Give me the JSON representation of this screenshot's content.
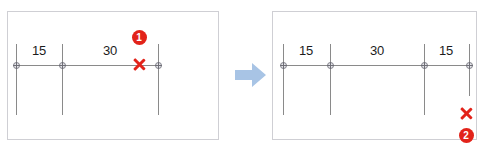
{
  "figure": {
    "clipped_header_text": "▪ ▪  ▪ ▪   ▪",
    "arrow_color": "#a8c4e5",
    "callout_color": "#e2231a",
    "line_color": "#8a8a8a"
  },
  "panels": [
    {
      "id": "before",
      "nodes": [
        {
          "x": 16,
          "label": null
        },
        {
          "x": 62,
          "label": null
        },
        {
          "x": 158,
          "label": null
        }
      ],
      "dimensions": [
        {
          "text": "15",
          "center_x": 39
        },
        {
          "text": "30",
          "center_x": 110
        }
      ],
      "callout": {
        "x_mark_x": 139,
        "x_mark_y": 64,
        "badge_x": 139,
        "badge_y": 37,
        "badge_label": "1"
      }
    },
    {
      "id": "after",
      "nodes": [
        {
          "x": 283,
          "label": null
        },
        {
          "x": 330,
          "label": null
        },
        {
          "x": 424,
          "label": null
        },
        {
          "x": 469,
          "label": null
        }
      ],
      "dimensions": [
        {
          "text": "15",
          "center_x": 306
        },
        {
          "text": "30",
          "center_x": 377
        },
        {
          "text": "15",
          "center_x": 446
        }
      ],
      "callout": {
        "x_mark_x": 466,
        "x_mark_y": 113,
        "badge_x": 466,
        "badge_y": 135,
        "badge_label": "2"
      }
    }
  ],
  "arrow": {
    "name": "transition-arrow-right",
    "direction": "right"
  }
}
